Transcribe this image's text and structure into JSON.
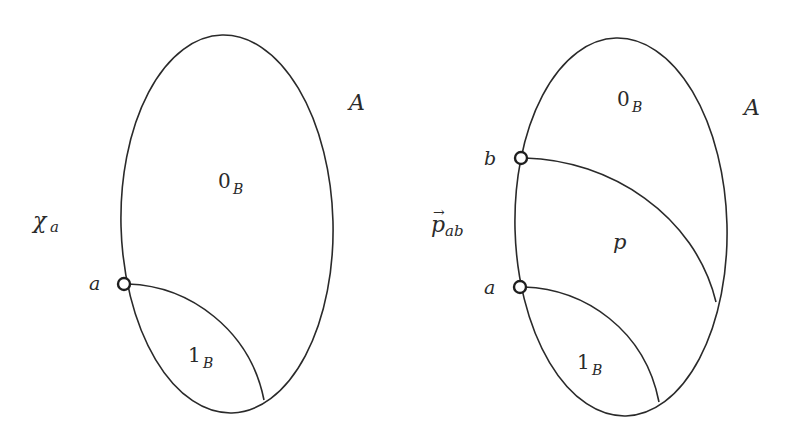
{
  "diagrams": [
    {
      "id": "left",
      "set_label": "A",
      "function_label": {
        "base": "χ",
        "sub": "a"
      },
      "regions": [
        {
          "name": "zero-region",
          "base": "0",
          "sub": "B"
        },
        {
          "name": "one-region",
          "base": "1",
          "sub": "B"
        }
      ],
      "points": [
        {
          "name": "point-a",
          "label": "a"
        }
      ]
    },
    {
      "id": "right",
      "set_label": "A",
      "function_label": {
        "base": "p",
        "sub": "ab",
        "accent": "→"
      },
      "regions": [
        {
          "name": "zero-region",
          "base": "0",
          "sub": "B"
        },
        {
          "name": "p-region",
          "base": "p",
          "sub": ""
        },
        {
          "name": "one-region",
          "base": "1",
          "sub": "B"
        }
      ],
      "points": [
        {
          "name": "point-b",
          "label": "b"
        },
        {
          "name": "point-a",
          "label": "a"
        }
      ]
    }
  ]
}
